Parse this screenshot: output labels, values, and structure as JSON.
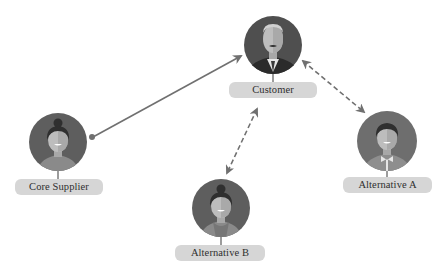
{
  "diagram": {
    "type": "relationship-network",
    "colors": {
      "avatar_bg": "#5c5c5c",
      "avatar_bg_light": "#7a7a7a",
      "label_bg": "#d6d6d6",
      "label_text": "#2e2e2e",
      "connector": "#707070",
      "skin": "#b9b9b9",
      "skin_shade": "#a3a3a3",
      "hair": "#2f2f2f"
    },
    "nodes": [
      {
        "id": "customer",
        "label": "Customer",
        "avatar": "man-in-suit-avatar"
      },
      {
        "id": "core-supplier",
        "label": "Core Supplier",
        "avatar": "woman-with-bun-avatar"
      },
      {
        "id": "alternative-a",
        "label": "Alternative A",
        "avatar": "man-with-bowtie-avatar"
      },
      {
        "id": "alternative-b",
        "label": "Alternative B",
        "avatar": "woman-with-bun-avatar"
      }
    ],
    "edges": [
      {
        "from": "core-supplier",
        "to": "customer",
        "style": "solid",
        "start": "dot",
        "end": "arrow"
      },
      {
        "from": "customer",
        "to": "alternative-a",
        "style": "dashed",
        "start": "arrow",
        "end": "arrow"
      },
      {
        "from": "customer",
        "to": "alternative-b",
        "style": "dashed",
        "start": "arrow",
        "end": "arrow"
      }
    ]
  }
}
